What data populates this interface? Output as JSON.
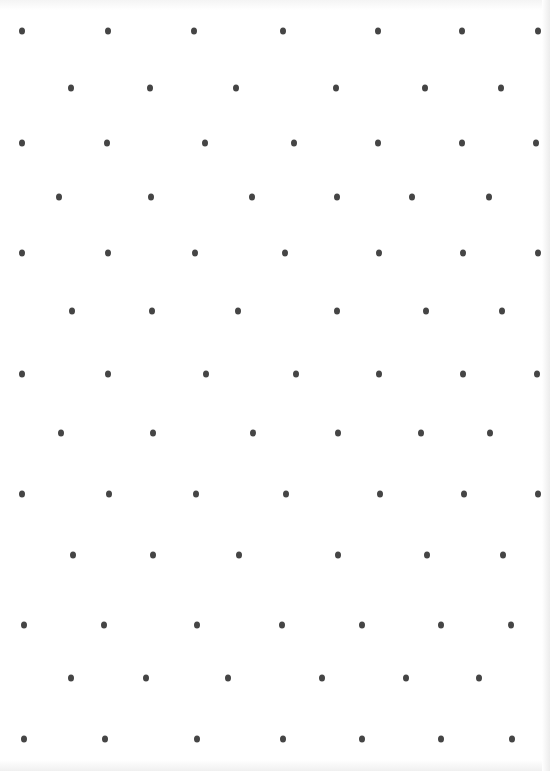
{
  "page": {
    "type": "dot-grid-paper",
    "dot_color": "#454545",
    "paper_color": "#ffffff"
  },
  "rows": [
    {
      "y": 31,
      "xs": [
        22,
        108,
        194,
        283,
        378,
        462,
        538
      ]
    },
    {
      "y": 88,
      "xs": [
        71,
        150,
        236,
        336,
        425,
        501
      ]
    },
    {
      "y": 143,
      "xs": [
        22,
        107,
        205,
        294,
        378,
        462,
        536
      ]
    },
    {
      "y": 197,
      "xs": [
        59,
        151,
        252,
        337,
        412,
        489
      ]
    },
    {
      "y": 253,
      "xs": [
        22,
        108,
        195,
        285,
        379,
        463,
        538
      ]
    },
    {
      "y": 311,
      "xs": [
        72,
        152,
        238,
        337,
        426,
        502
      ]
    },
    {
      "y": 374,
      "xs": [
        22,
        108,
        206,
        296,
        379,
        463,
        537
      ]
    },
    {
      "y": 433,
      "xs": [
        61,
        153,
        253,
        338,
        421,
        490
      ]
    },
    {
      "y": 494,
      "xs": [
        22,
        109,
        196,
        286,
        380,
        464,
        538
      ]
    },
    {
      "y": 555,
      "xs": [
        73,
        153,
        239,
        338,
        427,
        503
      ]
    },
    {
      "y": 625,
      "xs": [
        24,
        104,
        197,
        282,
        362,
        441,
        511
      ]
    },
    {
      "y": 678,
      "xs": [
        71,
        146,
        228,
        322,
        406,
        479
      ]
    },
    {
      "y": 739,
      "xs": [
        24,
        105,
        197,
        283,
        362,
        441,
        512
      ]
    }
  ]
}
